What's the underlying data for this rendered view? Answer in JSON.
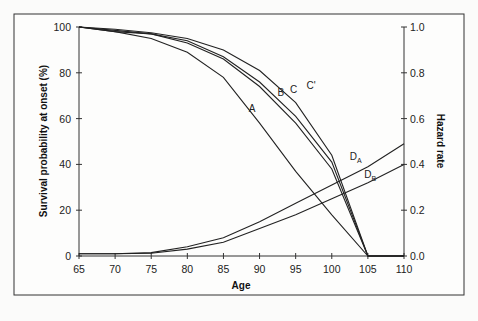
{
  "chart_data": {
    "type": "line",
    "title": "",
    "xlabel": "Age",
    "ylabel": "Survival probability at onset (%)",
    "y2label": "Hazard rate",
    "xlim": [
      65,
      110
    ],
    "ylim": [
      0,
      100
    ],
    "y2lim": [
      0.0,
      1.0
    ],
    "xticks": [
      "65",
      "70",
      "75",
      "80",
      "85",
      "90",
      "95",
      "100",
      "105",
      "110"
    ],
    "yticks": [
      "0",
      "20",
      "40",
      "60",
      "80",
      "100"
    ],
    "y2ticks": [
      "0.0",
      "0.2",
      "0.4",
      "0.6",
      "0.8",
      "1.0"
    ],
    "grid": false,
    "legend": "inline curve labels",
    "x": [
      65,
      70,
      75,
      80,
      85,
      90,
      95,
      100,
      105,
      110
    ],
    "series": [
      {
        "name": "A",
        "axis": "left",
        "values": [
          100,
          98,
          95,
          89,
          78,
          58,
          37,
          18,
          0,
          null
        ]
      },
      {
        "name": "B",
        "axis": "left",
        "values": [
          100,
          98,
          97,
          93,
          86,
          74,
          58,
          38,
          0,
          null
        ]
      },
      {
        "name": "C",
        "axis": "left",
        "values": [
          100,
          98.5,
          97,
          94,
          87,
          76,
          61,
          41,
          0,
          null
        ]
      },
      {
        "name": "C'",
        "axis": "left",
        "values": [
          100,
          99,
          97.5,
          95,
          90,
          81,
          67,
          44,
          0,
          null
        ]
      },
      {
        "name": "DA",
        "axis": "right",
        "values": [
          0.01,
          0.01,
          0.015,
          0.04,
          0.08,
          0.15,
          0.23,
          0.31,
          0.39,
          0.49
        ]
      },
      {
        "name": "DB",
        "axis": "right",
        "values": [
          0.01,
          0.01,
          0.012,
          0.03,
          0.06,
          0.12,
          0.18,
          0.25,
          0.32,
          0.4
        ]
      }
    ],
    "annotations": [
      {
        "text": "A",
        "x": 88.5,
        "y": 63
      },
      {
        "text": "B",
        "x": 92.5,
        "y": 70
      },
      {
        "text": "C",
        "x": 94.2,
        "y": 71
      },
      {
        "text": "C'",
        "x": 96.5,
        "y": 73
      },
      {
        "text": "DA",
        "x": 102.5,
        "y2": 0.42
      },
      {
        "text": "DB",
        "x": 104.5,
        "y2": 0.34
      }
    ]
  }
}
